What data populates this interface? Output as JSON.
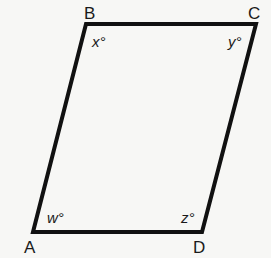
{
  "diagram": {
    "type": "parallelogram",
    "stroke_color": "#111111",
    "background_color": "#f7f7f5",
    "vertices": {
      "A": {
        "label": "A",
        "x": 33,
        "y": 232
      },
      "B": {
        "label": "B",
        "x": 86,
        "y": 24
      },
      "C": {
        "label": "C",
        "x": 256,
        "y": 24
      },
      "D": {
        "label": "D",
        "x": 202,
        "y": 232
      }
    },
    "angles": {
      "A": {
        "label": "w°",
        "variable": "w"
      },
      "B": {
        "label": "x°",
        "variable": "x"
      },
      "C": {
        "label": "y°",
        "variable": "y"
      },
      "D": {
        "label": "z°",
        "variable": "z"
      }
    }
  }
}
